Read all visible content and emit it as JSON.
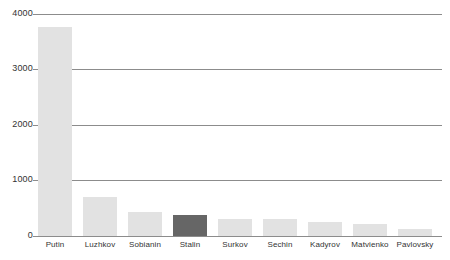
{
  "chart_data": {
    "type": "bar",
    "title": "",
    "subtitle": "",
    "xlabel": "",
    "ylabel": "",
    "ylim": [
      0,
      4000
    ],
    "grid": true,
    "legend": false,
    "yticks": [
      "0",
      "1000",
      "2000",
      "3000",
      "4000"
    ],
    "ytick_values": [
      0,
      1000,
      2000,
      3000,
      4000
    ],
    "categories": [
      "Putin",
      "Luzhkov",
      "Sobianin",
      "Stalin",
      "Surkov",
      "Sechin",
      "Kadyrov",
      "Matvienko",
      "Pavlovsky"
    ],
    "values": [
      3760,
      700,
      430,
      380,
      310,
      305,
      250,
      215,
      120
    ],
    "highlight_index": 3,
    "colors": {
      "bar": "#e2e2e2",
      "bar_highlight": "#666666",
      "gridline": "#8c8c8c",
      "axis_text": "#333333",
      "background": "#ffffff"
    }
  }
}
